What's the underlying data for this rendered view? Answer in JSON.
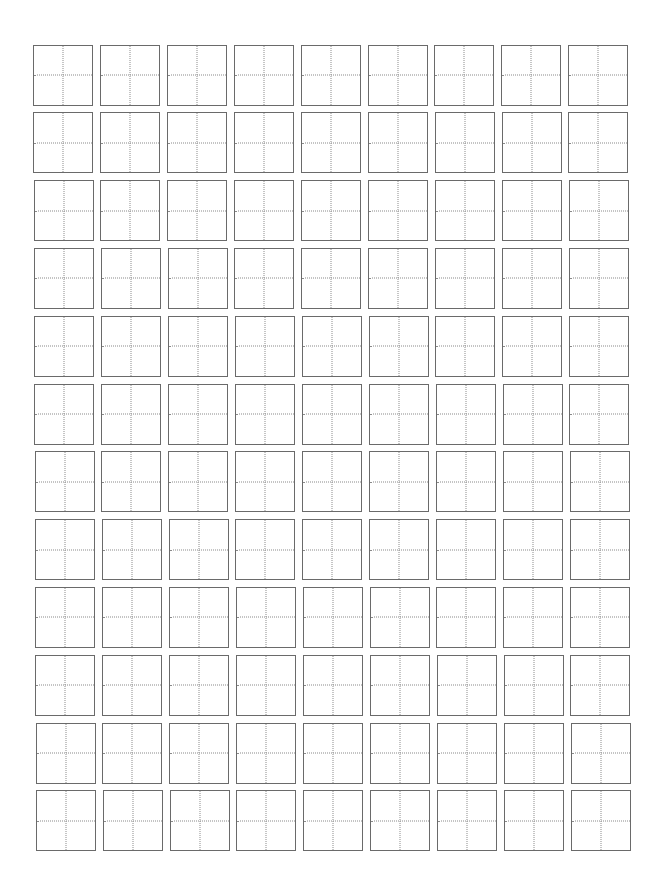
{
  "worksheet": {
    "type": "tianzige-writing-grid",
    "columns": 9,
    "rows": 12,
    "cell_style": {
      "border_color": "#6a6a6a",
      "guide_color": "#8a8a8a",
      "guide_style": "dotted-cross",
      "background": "#ffffff"
    },
    "cells_filled": 0
  }
}
